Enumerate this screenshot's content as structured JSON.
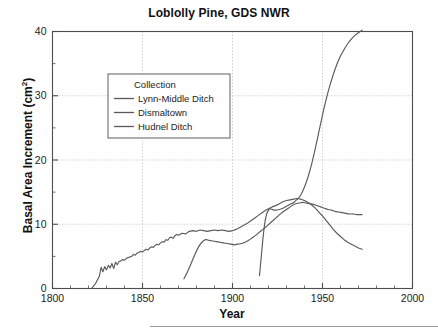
{
  "chart_data": {
    "type": "line",
    "title": "Loblolly Pine, GDS NWR",
    "xlabel": "Year",
    "ylabel": "Basal Area Increment (cm2)",
    "ylabel_display": "Basal Area Increment (cm²)",
    "xlim": [
      1800,
      2000
    ],
    "ylim": [
      0,
      40
    ],
    "xticks": [
      1800,
      1850,
      1900,
      1950,
      2000
    ],
    "xtick_labels": [
      "1800",
      "1850",
      "1900",
      "1950",
      "2000"
    ],
    "xminor_step": 10,
    "yticks": [
      0,
      10,
      20,
      30,
      40
    ],
    "ytick_labels": [
      "0",
      "10",
      "20",
      "30",
      "40"
    ],
    "yminor_step": 5,
    "grid": "dotted gridlines at major x and y ticks",
    "legend": {
      "title": "Collection",
      "position": "upper-left inside axes",
      "entries": [
        "Lynn-Middle Ditch",
        "Dismaltown",
        "Hudnel Ditch"
      ]
    },
    "line_color": "#5a5a5a",
    "axis_color": "#4d4d4d",
    "grid_color": "#b5b5b5",
    "series": [
      {
        "name": "Lynn-Middle Ditch",
        "x": [
          1822,
          1824,
          1826,
          1827,
          1828,
          1829,
          1830,
          1831,
          1832,
          1833,
          1834,
          1835,
          1836,
          1837,
          1838,
          1839,
          1840,
          1841,
          1842,
          1843,
          1844,
          1845,
          1846,
          1847,
          1848,
          1849,
          1850,
          1851,
          1852,
          1853,
          1854,
          1855,
          1856,
          1857,
          1858,
          1859,
          1860,
          1861,
          1862,
          1863,
          1864,
          1865,
          1866,
          1867,
          1868,
          1869,
          1870,
          1872,
          1874,
          1876,
          1878,
          1880,
          1882,
          1884,
          1886,
          1888,
          1890,
          1892,
          1894,
          1896,
          1898,
          1900,
          1902,
          1904,
          1906,
          1908,
          1910,
          1912,
          1914,
          1916,
          1918,
          1920,
          1922,
          1924,
          1926,
          1928,
          1930,
          1932,
          1934,
          1936,
          1938,
          1940,
          1942,
          1944,
          1946,
          1948,
          1950,
          1952,
          1954,
          1956,
          1958,
          1960,
          1962,
          1964,
          1966,
          1968,
          1970,
          1972
        ],
        "y": [
          0.1,
          0.8,
          1.9,
          3.3,
          2.6,
          3.4,
          2.9,
          3.6,
          3.2,
          3.9,
          3.1,
          4.1,
          3.7,
          4.2,
          4.3,
          4.5,
          4.4,
          4.7,
          4.8,
          4.9,
          5.0,
          5.3,
          5.2,
          5.5,
          5.6,
          5.8,
          5.7,
          5.9,
          6.1,
          6.0,
          6.3,
          6.5,
          6.4,
          6.7,
          6.9,
          6.8,
          7.1,
          7.3,
          7.2,
          7.6,
          7.5,
          7.9,
          8.0,
          7.8,
          8.2,
          8.4,
          8.3,
          8.6,
          8.5,
          8.9,
          9.0,
          8.9,
          9.1,
          9.0,
          8.9,
          9.0,
          9.1,
          9.0,
          9.1,
          9.0,
          8.9,
          9.0,
          9.2,
          9.5,
          9.8,
          10.1,
          10.5,
          10.9,
          11.3,
          11.7,
          12.1,
          12.4,
          12.7,
          12.9,
          13.2,
          13.5,
          13.7,
          13.8,
          13.9,
          14.0,
          13.9,
          13.7,
          13.4,
          13.0,
          12.5,
          11.9,
          11.3,
          10.6,
          9.9,
          9.2,
          8.6,
          8.1,
          7.6,
          7.2,
          6.9,
          6.6,
          6.3,
          6.1
        ]
      },
      {
        "name": "Dismaltown",
        "x": [
          1873,
          1875,
          1877,
          1879,
          1881,
          1883,
          1885,
          1887,
          1889,
          1891,
          1893,
          1895,
          1897,
          1899,
          1901,
          1903,
          1905,
          1907,
          1909,
          1911,
          1913,
          1915,
          1917,
          1919,
          1921,
          1923,
          1925,
          1927,
          1929,
          1931,
          1933,
          1935,
          1937,
          1939,
          1941,
          1943,
          1945,
          1947,
          1949,
          1951,
          1953,
          1955,
          1957,
          1959,
          1961,
          1963,
          1965,
          1967,
          1969,
          1971,
          1972
        ],
        "y": [
          1.5,
          2.6,
          3.9,
          5.2,
          6.4,
          7.2,
          7.6,
          7.5,
          7.4,
          7.3,
          7.2,
          7.1,
          7.0,
          6.9,
          6.8,
          6.9,
          7.0,
          7.2,
          7.5,
          7.9,
          8.3,
          8.8,
          9.2,
          9.7,
          10.2,
          10.7,
          11.2,
          11.7,
          12.1,
          12.5,
          12.9,
          13.2,
          13.3,
          13.4,
          13.3,
          13.2,
          13.1,
          12.9,
          12.7,
          12.5,
          12.3,
          12.2,
          12.0,
          11.9,
          11.8,
          11.7,
          11.6,
          11.6,
          11.5,
          11.5,
          11.5
        ]
      },
      {
        "name": "Hudnel Ditch",
        "x": [
          1915,
          1916,
          1917,
          1918,
          1919,
          1920,
          1921,
          1922,
          1924,
          1926,
          1928,
          1930,
          1932,
          1934,
          1936,
          1938,
          1940,
          1942,
          1944,
          1946,
          1948,
          1950,
          1952,
          1954,
          1956,
          1958,
          1960,
          1962,
          1964,
          1966,
          1968,
          1970,
          1972
        ],
        "y": [
          2.0,
          5.0,
          8.0,
          10.3,
          11.6,
          12.2,
          12.4,
          12.3,
          12.2,
          12.3,
          12.5,
          12.8,
          13.1,
          13.4,
          13.9,
          14.6,
          15.8,
          17.4,
          19.4,
          21.8,
          24.4,
          27.0,
          29.4,
          31.5,
          33.3,
          34.9,
          36.2,
          37.2,
          38.1,
          38.8,
          39.4,
          39.8,
          40.2
        ]
      }
    ]
  }
}
